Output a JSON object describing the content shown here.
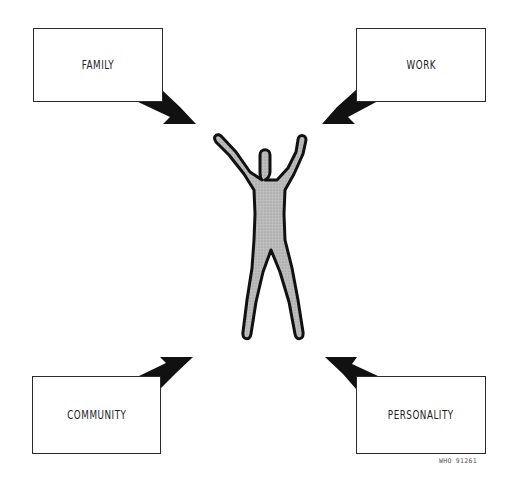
{
  "diagram": {
    "center": {
      "label": "person-figure",
      "fill": "#b9b9b9",
      "outline": "#111111"
    },
    "boxes": [
      {
        "id": "family",
        "label": "FAMILY"
      },
      {
        "id": "work",
        "label": "WORK"
      },
      {
        "id": "community",
        "label": "COMMUNITY"
      },
      {
        "id": "personality",
        "label": "PERSONALITY"
      }
    ],
    "arrows": [
      {
        "from": "FAMILY",
        "to": "person"
      },
      {
        "from": "WORK",
        "to": "person"
      },
      {
        "from": "COMMUNITY",
        "to": "person"
      },
      {
        "from": "PERSONALITY",
        "to": "person"
      }
    ],
    "code": "WHO 91261"
  }
}
